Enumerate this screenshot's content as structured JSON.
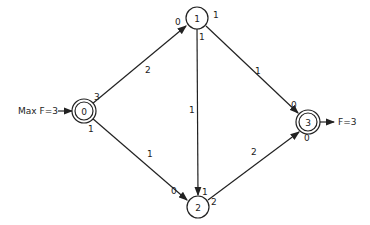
{
  "diagram": {
    "type": "flow-network",
    "source_label": "Max F=3",
    "sink_label": "F=3",
    "nodes": [
      {
        "id": "0",
        "label": "0",
        "x": 84,
        "y": 111,
        "double": true
      },
      {
        "id": "1",
        "label": "1",
        "x": 197,
        "y": 18,
        "double": false
      },
      {
        "id": "2",
        "label": "2",
        "x": 198,
        "y": 207,
        "double": false
      },
      {
        "id": "3",
        "label": "3",
        "x": 308,
        "y": 122,
        "double": true
      }
    ],
    "edges": [
      {
        "from": "0",
        "to": "1",
        "capacity": "2",
        "start_label": "3",
        "end_label": "0"
      },
      {
        "from": "0",
        "to": "2",
        "capacity": "1",
        "start_label": "1",
        "end_label": "0"
      },
      {
        "from": "1",
        "to": "2",
        "capacity": "1",
        "start_label": "1",
        "end_label": "1"
      },
      {
        "from": "1",
        "to": "3",
        "capacity": "1",
        "start_label": "1",
        "end_label": "0"
      },
      {
        "from": "2",
        "to": "3",
        "capacity": "2",
        "start_label": "2",
        "end_label": "0"
      }
    ]
  }
}
